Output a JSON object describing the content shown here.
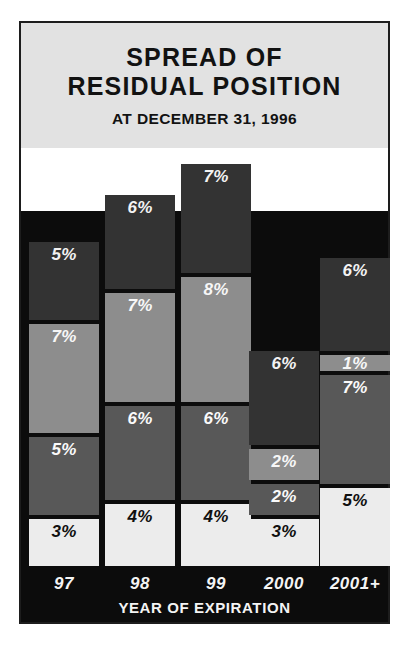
{
  "header": {
    "title_line1": "SPREAD OF",
    "title_line2": "RESIDUAL POSITION",
    "subtitle": "AT DECEMBER 31, 1996"
  },
  "axis": {
    "x_title": "YEAR OF EXPIRATION"
  },
  "colors": {
    "frame_border": "#1d1d1d",
    "header_background": "#e2e2e2",
    "plot_background": "#0c0c0c",
    "segment_dark": "#333333",
    "segment_light": "#8d8d8d",
    "segment_mid": "#585858",
    "segment_white": "#ececec",
    "text_light": "#f4f4f4",
    "text_dark": "#101010"
  },
  "chart_data": {
    "type": "bar",
    "title": "SPREAD OF RESIDUAL POSITION",
    "subtitle": "AT DECEMBER 31, 1996",
    "xlabel": "YEAR OF EXPIRATION",
    "ylabel": "",
    "stacked": true,
    "grid": false,
    "legend": "none",
    "ylim": [
      0,
      25
    ],
    "categories": [
      "97",
      "98",
      "99",
      "2000",
      "2001+"
    ],
    "series": [
      {
        "name": "band-4-top",
        "shade": "dark",
        "values": [
          5,
          6,
          7,
          6,
          6
        ],
        "labels": [
          "5%",
          "6%",
          "7%",
          "6%",
          "6%"
        ]
      },
      {
        "name": "band-3",
        "shade": "light",
        "values": [
          7,
          7,
          8,
          2,
          1
        ],
        "labels": [
          "7%",
          "7%",
          "8%",
          "2%",
          "1%"
        ]
      },
      {
        "name": "band-2",
        "shade": "mid",
        "values": [
          5,
          6,
          6,
          2,
          7
        ],
        "labels": [
          "5%",
          "6%",
          "6%",
          "2%",
          "7%"
        ]
      },
      {
        "name": "band-1-bottom",
        "shade": "white",
        "values": [
          3,
          4,
          4,
          3,
          5
        ],
        "labels": [
          "3%",
          "4%",
          "4%",
          "3%",
          "5%"
        ]
      }
    ],
    "totals": [
      20,
      23,
      25,
      13,
      19
    ]
  }
}
